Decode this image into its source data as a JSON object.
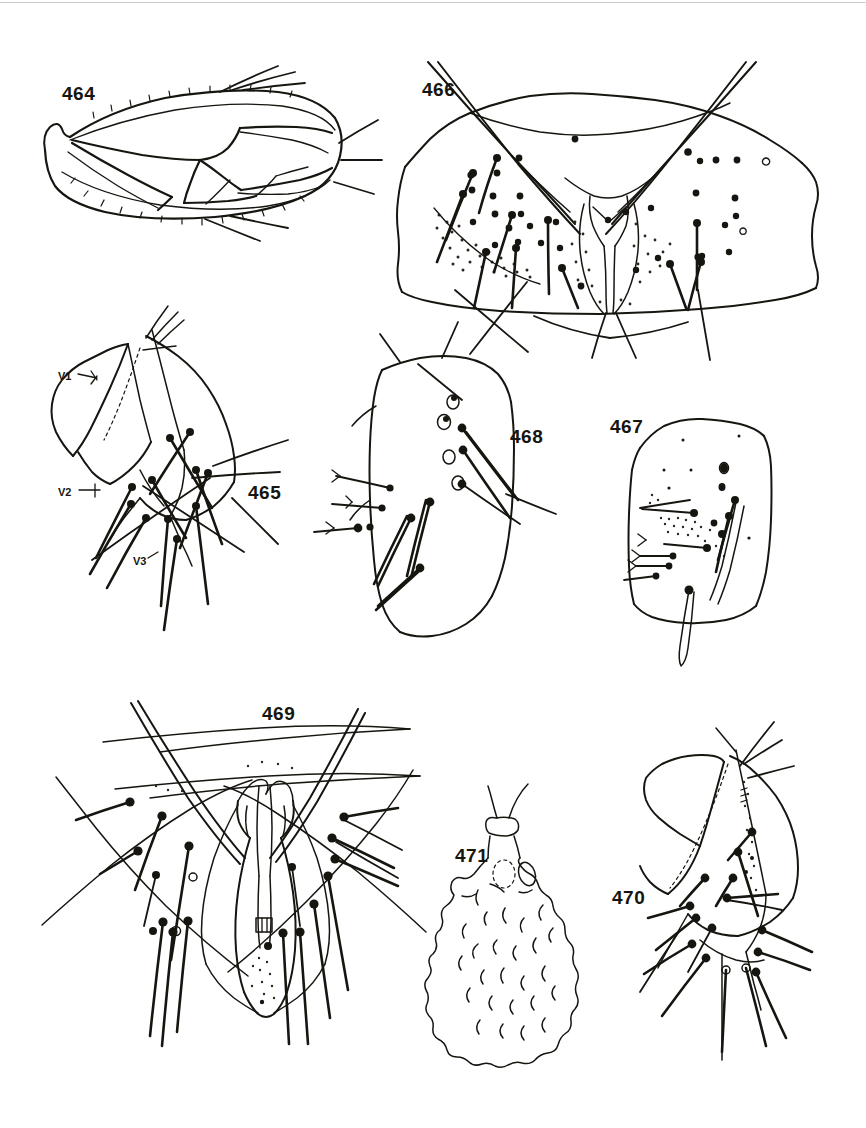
{
  "plate": {
    "kind": "scientific-illustration-plate",
    "subject": "insect morphology line drawings",
    "background_color": "#ffffff",
    "ink_color": "#17150f",
    "width": 866,
    "height": 1128
  },
  "figures": [
    {
      "number": "464",
      "label_x": 62,
      "label_y": 84,
      "caption": "forewing with venation and marginal setae",
      "region": "top-left"
    },
    {
      "number": "466",
      "label_x": 422,
      "label_y": 80,
      "caption": "abdominal segment plate with setae and stippled patches",
      "region": "top-right"
    },
    {
      "number": "465",
      "label_x": 248,
      "label_y": 483,
      "caption": "lateral valvulae with setae",
      "region": "middle-left"
    },
    {
      "number": "468",
      "label_x": 510,
      "label_y": 427,
      "caption": "oval plate with setae",
      "region": "middle-center"
    },
    {
      "number": "467",
      "label_x": 610,
      "label_y": 417,
      "caption": "rounded plate with stippling and setae",
      "region": "middle-right"
    },
    {
      "number": "469",
      "label_x": 262,
      "label_y": 704,
      "caption": "symmetrical genital structure with paired setae",
      "region": "bottom-left"
    },
    {
      "number": "471",
      "label_x": 455,
      "label_y": 846,
      "caption": "lobed spermatheca-like structure",
      "region": "bottom-center"
    },
    {
      "number": "470",
      "label_x": 612,
      "label_y": 888,
      "caption": "valvula with dotted line and setae",
      "region": "bottom-right"
    }
  ],
  "annotations": [
    {
      "text": "V1",
      "x": 58,
      "y": 371,
      "figure": "465"
    },
    {
      "text": "V2",
      "x": 58,
      "y": 487,
      "figure": "465"
    },
    {
      "text": "V3",
      "x": 133,
      "y": 556,
      "figure": "465"
    }
  ]
}
